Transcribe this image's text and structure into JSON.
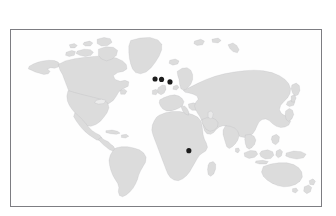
{
  "figure": {
    "type": "world-map",
    "title": "",
    "caption": "",
    "background_color": "#ffffff"
  },
  "map": {
    "projection_label": "equirectangular",
    "frame": {
      "border_color": "#7d7d82",
      "border_width_px": 1,
      "ocean_color": "#fefefe",
      "left_px": 10,
      "top_px": 29,
      "width_px": 312,
      "height_px": 178
    },
    "land": {
      "fill_color": "#dcdcdc",
      "outline_color": "#8e8e93"
    },
    "graticule_visible": false,
    "labels_visible": false
  },
  "markers": {
    "style": {
      "color": "#1c1c1c",
      "shape": "filled-circle",
      "radius_px": 2.6
    },
    "count": 4,
    "points": [
      {
        "name": "marker-western-europe-british-isles",
        "region": "Western Europe",
        "x": 155.0,
        "y": 78.5
      },
      {
        "name": "marker-western-europe-low-countries",
        "region": "Western Europe",
        "x": 161.5,
        "y": 79.0
      },
      {
        "name": "marker-central-europe",
        "region": "Central Europe",
        "x": 170.0,
        "y": 81.5
      },
      {
        "name": "marker-east-africa",
        "region": "East Africa",
        "x": 189.0,
        "y": 151.0
      }
    ]
  },
  "legend": {
    "visible": false,
    "entries": []
  }
}
